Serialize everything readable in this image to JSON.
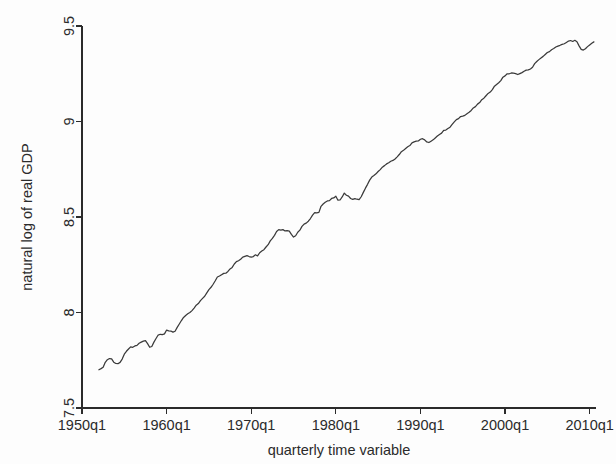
{
  "chart_data": {
    "type": "line",
    "title": "",
    "subtitle": "",
    "xlabel": "quarterly time variable",
    "ylabel": "natural log of real GDP",
    "xlim": [
      1950.0,
      2010.75
    ],
    "ylim": [
      7.5,
      9.5
    ],
    "xticks": [
      1950,
      1960,
      1970,
      1980,
      1990,
      2000,
      2010
    ],
    "xtick_labels": [
      "1950q1",
      "1960q1",
      "1970q1",
      "1980q1",
      "1990q1",
      "2000q1",
      "2010q1"
    ],
    "yticks": [
      7.5,
      8,
      8.5,
      9,
      9.5
    ],
    "ytick_labels": [
      "7.5",
      "8",
      "8.5",
      "9",
      "9.5"
    ],
    "grid": false,
    "legend": false,
    "legend_position": "none",
    "line_color": "#3a3a3a",
    "series": [
      {
        "name": "natural log of real GDP",
        "x": [
          1952.0,
          1952.25,
          1952.5,
          1952.75,
          1953.0,
          1953.25,
          1953.5,
          1953.75,
          1954.0,
          1954.25,
          1954.5,
          1954.75,
          1955.0,
          1955.25,
          1955.5,
          1955.75,
          1956.0,
          1956.25,
          1956.5,
          1956.75,
          1957.0,
          1957.25,
          1957.5,
          1957.75,
          1958.0,
          1958.25,
          1958.5,
          1958.75,
          1959.0,
          1959.25,
          1959.5,
          1959.75,
          1960.0,
          1960.25,
          1960.5,
          1960.75,
          1961.0,
          1961.25,
          1961.5,
          1961.75,
          1962.0,
          1962.25,
          1962.5,
          1962.75,
          1963.0,
          1963.25,
          1963.5,
          1963.75,
          1964.0,
          1964.25,
          1964.5,
          1964.75,
          1965.0,
          1965.25,
          1965.5,
          1965.75,
          1966.0,
          1966.25,
          1966.5,
          1966.75,
          1967.0,
          1967.25,
          1967.5,
          1967.75,
          1968.0,
          1968.25,
          1968.5,
          1968.75,
          1969.0,
          1969.25,
          1969.5,
          1969.75,
          1970.0,
          1970.25,
          1970.5,
          1970.75,
          1971.0,
          1971.25,
          1971.5,
          1971.75,
          1972.0,
          1972.25,
          1972.5,
          1972.75,
          1973.0,
          1973.25,
          1973.5,
          1973.75,
          1974.0,
          1974.25,
          1974.5,
          1974.75,
          1975.0,
          1975.25,
          1975.5,
          1975.75,
          1976.0,
          1976.25,
          1976.5,
          1976.75,
          1977.0,
          1977.25,
          1977.5,
          1977.75,
          1978.0,
          1978.25,
          1978.5,
          1978.75,
          1979.0,
          1979.25,
          1979.5,
          1979.75,
          1980.0,
          1980.25,
          1980.5,
          1980.75,
          1981.0,
          1981.25,
          1981.5,
          1981.75,
          1982.0,
          1982.25,
          1982.5,
          1982.75,
          1983.0,
          1983.25,
          1983.5,
          1983.75,
          1984.0,
          1984.25,
          1984.5,
          1984.75,
          1985.0,
          1985.25,
          1985.5,
          1985.75,
          1986.0,
          1986.25,
          1986.5,
          1986.75,
          1987.0,
          1987.25,
          1987.5,
          1987.75,
          1988.0,
          1988.25,
          1988.5,
          1988.75,
          1989.0,
          1989.25,
          1989.5,
          1989.75,
          1990.0,
          1990.25,
          1990.5,
          1990.75,
          1991.0,
          1991.25,
          1991.5,
          1991.75,
          1992.0,
          1992.25,
          1992.5,
          1992.75,
          1993.0,
          1993.25,
          1993.5,
          1993.75,
          1994.0,
          1994.25,
          1994.5,
          1994.75,
          1995.0,
          1995.25,
          1995.5,
          1995.75,
          1996.0,
          1996.25,
          1996.5,
          1996.75,
          1997.0,
          1997.25,
          1997.5,
          1997.75,
          1998.0,
          1998.25,
          1998.5,
          1998.75,
          1999.0,
          1999.25,
          1999.5,
          1999.75,
          2000.0,
          2000.25,
          2000.5,
          2000.75,
          2001.0,
          2001.25,
          2001.5,
          2001.75,
          2002.0,
          2002.25,
          2002.5,
          2002.75,
          2003.0,
          2003.25,
          2003.5,
          2003.75,
          2004.0,
          2004.25,
          2004.5,
          2004.75,
          2005.0,
          2005.25,
          2005.5,
          2005.75,
          2006.0,
          2006.25,
          2006.5,
          2006.75,
          2007.0,
          2007.25,
          2007.5,
          2007.75,
          2008.0,
          2008.25,
          2008.5,
          2008.75,
          2009.0,
          2009.25,
          2009.5,
          2009.75,
          2010.0,
          2010.25,
          2010.5
        ],
        "y": [
          7.7,
          7.706,
          7.713,
          7.739,
          7.753,
          7.759,
          7.757,
          7.74,
          7.733,
          7.732,
          7.739,
          7.756,
          7.782,
          7.797,
          7.809,
          7.82,
          7.818,
          7.825,
          7.828,
          7.839,
          7.845,
          7.85,
          7.853,
          7.837,
          7.818,
          7.822,
          7.845,
          7.864,
          7.882,
          7.886,
          7.884,
          7.888,
          7.908,
          7.904,
          7.903,
          7.897,
          7.902,
          7.922,
          7.94,
          7.958,
          7.974,
          7.984,
          7.993,
          8.0,
          8.01,
          8.023,
          8.038,
          8.047,
          8.062,
          8.074,
          8.085,
          8.103,
          8.12,
          8.132,
          8.148,
          8.166,
          8.186,
          8.191,
          8.198,
          8.205,
          8.206,
          8.215,
          8.228,
          8.236,
          8.254,
          8.266,
          8.271,
          8.279,
          8.29,
          8.294,
          8.298,
          8.293,
          8.29,
          8.293,
          8.302,
          8.296,
          8.313,
          8.322,
          8.329,
          8.343,
          8.355,
          8.375,
          8.388,
          8.404,
          8.424,
          8.434,
          8.431,
          8.434,
          8.427,
          8.429,
          8.426,
          8.409,
          8.395,
          8.402,
          8.42,
          8.431,
          8.451,
          8.463,
          8.468,
          8.478,
          8.492,
          8.51,
          8.523,
          8.522,
          8.524,
          8.556,
          8.568,
          8.577,
          8.584,
          8.586,
          8.597,
          8.6,
          8.609,
          8.588,
          8.589,
          8.605,
          8.625,
          8.614,
          8.609,
          8.597,
          8.592,
          8.596,
          8.593,
          8.591,
          8.606,
          8.629,
          8.651,
          8.671,
          8.693,
          8.709,
          8.717,
          8.726,
          8.738,
          8.748,
          8.761,
          8.769,
          8.778,
          8.784,
          8.792,
          8.796,
          8.804,
          8.815,
          8.827,
          8.842,
          8.849,
          8.859,
          8.868,
          8.874,
          8.888,
          8.893,
          8.897,
          8.898,
          8.907,
          8.91,
          8.904,
          8.893,
          8.89,
          8.897,
          8.904,
          8.914,
          8.924,
          8.932,
          8.939,
          8.954,
          8.955,
          8.963,
          8.97,
          8.985,
          8.998,
          9.01,
          9.015,
          9.026,
          9.028,
          9.032,
          9.041,
          9.048,
          9.058,
          9.071,
          9.078,
          9.091,
          9.099,
          9.114,
          9.122,
          9.135,
          9.147,
          9.154,
          9.167,
          9.185,
          9.194,
          9.203,
          9.214,
          9.232,
          9.239,
          9.25,
          9.25,
          9.254,
          9.253,
          9.251,
          9.246,
          9.251,
          9.256,
          9.263,
          9.269,
          9.27,
          9.275,
          9.284,
          9.303,
          9.314,
          9.324,
          9.333,
          9.341,
          9.351,
          9.361,
          9.366,
          9.376,
          9.382,
          9.39,
          9.395,
          9.399,
          9.404,
          9.407,
          9.414,
          9.421,
          9.424,
          9.419,
          9.425,
          9.418,
          9.396,
          9.378,
          9.374,
          9.381,
          9.392,
          9.401,
          9.41,
          9.417
        ]
      }
    ],
    "annotations": []
  }
}
